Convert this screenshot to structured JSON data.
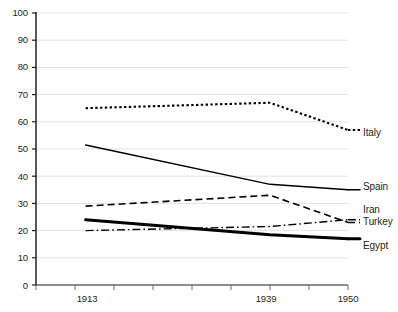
{
  "chart_data": {
    "type": "line",
    "title": "",
    "subtitle": "",
    "xlabel": "",
    "ylabel": "",
    "x": [
      1913,
      1939,
      1950
    ],
    "categories": [
      "1913",
      "1939",
      "1950"
    ],
    "xtick_labels": [
      "1913",
      "1939",
      "1950"
    ],
    "ytick_labels": [
      "0",
      "10",
      "20",
      "30",
      "40",
      "50",
      "60",
      "70",
      "80",
      "90",
      "100"
    ],
    "yticks": [
      0,
      10,
      20,
      30,
      40,
      50,
      60,
      70,
      80,
      90,
      100
    ],
    "ylim": [
      0,
      100
    ],
    "xlim": [
      1906,
      1950
    ],
    "grid": "horizontal",
    "legend_position": "right-inline-end-of-line",
    "series": [
      {
        "name": "Italy",
        "values": [
          65,
          67,
          57
        ],
        "style": "dotted",
        "color": "#000000",
        "width": 2.1
      },
      {
        "name": "Spain",
        "values": [
          51.5,
          37,
          35
        ],
        "style": "solid",
        "color": "#000000",
        "width": 1.5
      },
      {
        "name": "Iran",
        "values": [
          29,
          33,
          23
        ],
        "style": "dashed",
        "color": "#000000",
        "width": 1.6
      },
      {
        "name": "Turkey",
        "values": [
          20,
          21.5,
          24
        ],
        "style": "dash-dot",
        "color": "#000000",
        "width": 1.4
      },
      {
        "name": "Egypt",
        "values": [
          24,
          18.5,
          17
        ],
        "style": "solid",
        "color": "#000000",
        "width": 3.0
      }
    ],
    "axis_color": "#231f20",
    "grid_color": "#d9dadb"
  },
  "axis": {
    "y_labels": [
      "100",
      "90",
      "80",
      "70",
      "60",
      "50",
      "40",
      "30",
      "20",
      "10",
      "0"
    ],
    "x_labels": [
      "1913",
      "1939",
      "1950"
    ]
  },
  "legend": {
    "italy": "Italy",
    "spain": "Spain",
    "iran": "Iran",
    "turkey": "Turkey",
    "egypt": "Egypt"
  }
}
